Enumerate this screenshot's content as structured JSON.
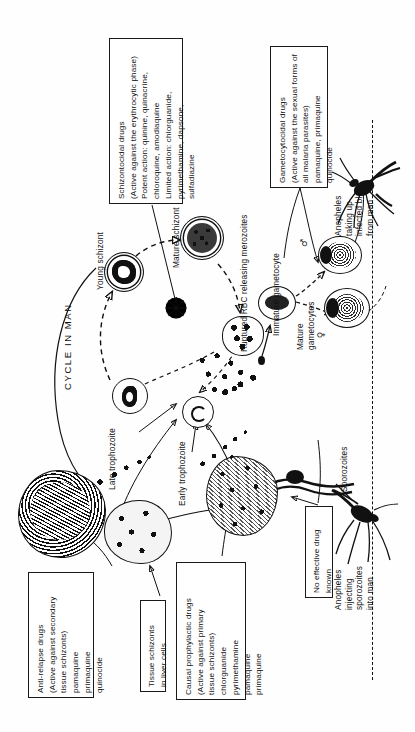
{
  "figure": {
    "cycle_label": "CYCLE IN MAN"
  },
  "boxes": [
    {
      "id": "schizontocidal",
      "name": "schizontocidal-drugs-box",
      "text": "Schizontocidal drugs\n(Active against the erythrocytic phase)\nPotent action: quinine, quinacrine,\nchloroquine, amodiaquine\nLimited action: chlorguanide,\npyrimethamine, dapsone,\nsulfadiazine"
    },
    {
      "id": "gametocytocidal",
      "name": "gametocytocidal-drugs-box",
      "text": "Gametocytocidal drugs\n(Active against the sexual forms of\nall malaria parasites)\npamaquine, primaquine\nquinocide"
    },
    {
      "id": "antirelapse",
      "name": "anti-relapse-drugs-box",
      "text": "Anti-relapse drugs\n(Active against secondary\ntissue schizonts)\npamaquine\nprimaquine\nquinocide"
    },
    {
      "id": "tissue_schizonts",
      "name": "tissue-schizonts-box",
      "text": "Tissue schizonts\nin liver cells"
    },
    {
      "id": "causal",
      "name": "causal-prophylactic-drugs-box",
      "text": "Causal prophylactic drugs\n(Active against primary\ntissue schizonts)\nchlorguanide\npyrimethamine\npamaquine\nprimaquine"
    },
    {
      "id": "nodrug",
      "name": "no-effective-drug-box",
      "text": "No effective drug\nknown"
    }
  ],
  "labels": [
    {
      "id": "young_schizont",
      "name": "label-young-schizont",
      "text": "Young schizont"
    },
    {
      "id": "mature_schizont",
      "name": "label-mature-schizont",
      "text": "Mature schizont"
    },
    {
      "id": "ruptured_rbc",
      "name": "label-ruptured-rbc",
      "text": "Ruptured RBC releasing merozoites"
    },
    {
      "id": "immature_gam",
      "name": "label-immature-gametocyte",
      "text": "Immature gametocyte"
    },
    {
      "id": "mature_gam",
      "name": "label-mature-gametocytes",
      "text": "Mature\ngametocytes"
    },
    {
      "id": "late_troph",
      "name": "label-late-trophozoite",
      "text": "Late trophozoite"
    },
    {
      "id": "early_troph",
      "name": "label-early-trophozoite",
      "text": "Early trophozoite"
    },
    {
      "id": "sporozoites",
      "name": "label-sporozoites",
      "text": "Sporozoites"
    },
    {
      "id": "anopheles_taking",
      "name": "label-anopheles-taking-up",
      "text": "Anopheles\ntaking up\ninfected blood\nfrom man"
    },
    {
      "id": "anopheles_inject",
      "name": "label-anopheles-injecting",
      "text": "Anopheles\ninjecting\nsporozoites\ninto man"
    }
  ],
  "symbols": {
    "male": "♂",
    "female": "♀"
  },
  "colors": {
    "ink": "#111111",
    "paper": "#ffffff"
  }
}
